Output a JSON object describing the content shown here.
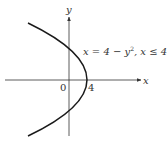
{
  "diagram": {
    "axes": {
      "x_label": "x",
      "y_label": "y",
      "origin_label": "0",
      "tick_label": "4"
    },
    "curve": {
      "equation_lhs": "x = 4 − y",
      "equation_exp": "2",
      "equation_rest": ", x ≤ 4"
    },
    "colors": {
      "curve": "#1a1a1a",
      "axis": "#333333",
      "text": "#333333"
    }
  }
}
